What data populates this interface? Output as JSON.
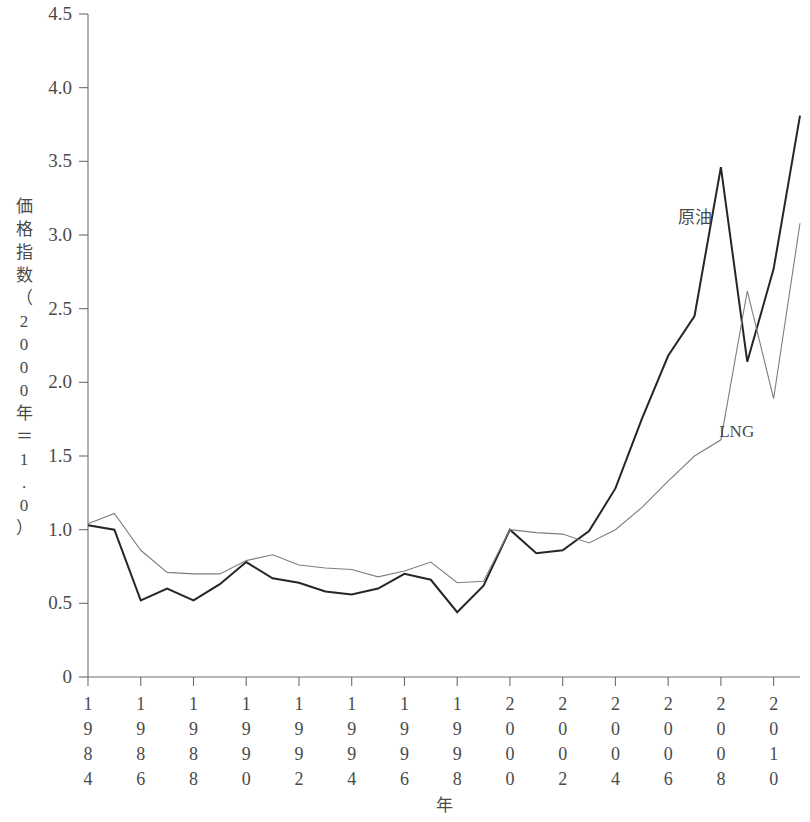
{
  "chart_data": {
    "type": "line",
    "title": "",
    "xlabel": "年",
    "ylabel": "価格指数（2000年＝1.0）",
    "ylabel_chars": [
      "価",
      "格",
      "指",
      "数",
      "（",
      "2",
      "0",
      "0",
      "0",
      "年",
      "＝",
      "1",
      ".",
      "0",
      "）"
    ],
    "xlim": [
      1984,
      2011
    ],
    "ylim": [
      0,
      4.5
    ],
    "grid": false,
    "legend": "inline-annotation",
    "ytick_labels": [
      "4.5",
      "4.0",
      "3.5",
      "3.0",
      "2.5",
      "2.0",
      "1.5",
      "1.0",
      "0.5",
      "0"
    ],
    "ytick_values": [
      4.5,
      4.0,
      3.5,
      3.0,
      2.5,
      2.0,
      1.5,
      1.0,
      0.5,
      0
    ],
    "xtick_labels": [
      "1984",
      "1986",
      "1988",
      "1990",
      "1992",
      "1994",
      "1996",
      "1998",
      "2000",
      "2002",
      "2004",
      "2006",
      "2008",
      "2010"
    ],
    "xtick_values": [
      1984,
      1986,
      1988,
      1990,
      1992,
      1994,
      1996,
      1998,
      2000,
      2002,
      2004,
      2006,
      2008,
      2010
    ],
    "x": [
      1984,
      1985,
      1986,
      1987,
      1988,
      1989,
      1990,
      1991,
      1992,
      1993,
      1994,
      1995,
      1996,
      1997,
      1998,
      1999,
      2000,
      2001,
      2002,
      2003,
      2004,
      2005,
      2006,
      2007,
      2008,
      2009,
      2010,
      2011
    ],
    "series": [
      {
        "name": "原油",
        "color": "#262626",
        "width": 2.0,
        "label_x": 2007.0,
        "label_y": 3.08,
        "values": [
          1.03,
          1.0,
          0.52,
          0.6,
          0.52,
          0.63,
          0.78,
          0.67,
          0.64,
          0.58,
          0.56,
          0.6,
          0.7,
          0.66,
          0.44,
          0.62,
          1.0,
          0.84,
          0.86,
          0.99,
          1.28,
          1.75,
          2.18,
          2.45,
          3.46,
          2.14,
          2.77,
          3.81
        ]
      },
      {
        "name": "LNG",
        "color": "#7d7d7d",
        "width": 1.1,
        "label_x": 2008.6,
        "label_y": 1.63,
        "values": [
          1.04,
          1.11,
          0.86,
          0.71,
          0.7,
          0.7,
          0.79,
          0.83,
          0.76,
          0.74,
          0.73,
          0.68,
          0.72,
          0.78,
          0.64,
          0.65,
          1.0,
          0.98,
          0.97,
          0.91,
          1.0,
          1.15,
          1.33,
          1.5,
          1.61,
          2.62,
          1.89,
          3.08
        ]
      }
    ]
  }
}
